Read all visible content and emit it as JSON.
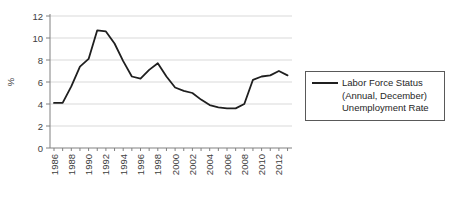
{
  "chart_data": {
    "type": "line",
    "title": "",
    "ylabel": "%",
    "ylim": [
      0,
      12
    ],
    "y_ticks": [
      0,
      2,
      4,
      6,
      8,
      10,
      12
    ],
    "x_tick_labels": [
      1986,
      1988,
      1990,
      1992,
      1994,
      1996,
      1998,
      2000,
      2002,
      2004,
      2006,
      2008,
      2010,
      2012
    ],
    "years": [
      1986,
      1987,
      1988,
      1989,
      1990,
      1991,
      1992,
      1993,
      1994,
      1995,
      1996,
      1997,
      1998,
      1999,
      2000,
      2001,
      2002,
      2003,
      2004,
      2005,
      2006,
      2007,
      2008,
      2009,
      2010,
      2011,
      2012,
      2013
    ],
    "values": [
      4.1,
      4.1,
      5.6,
      7.4,
      8.1,
      10.7,
      10.6,
      9.5,
      7.9,
      6.5,
      6.3,
      7.1,
      7.7,
      6.5,
      5.5,
      5.2,
      5.0,
      4.4,
      3.9,
      3.7,
      3.6,
      3.6,
      4.0,
      6.2,
      6.5,
      6.6,
      7.0,
      6.6
    ],
    "series_name": "Labor Force Status (Annual, December) Unemployment Rate",
    "legend_lines": [
      "Labor Force Status",
      "(Annual, December)",
      "Unemployment Rate"
    ],
    "legend_position": "right",
    "grid": "horizontal",
    "line_color": "#1f1f1f",
    "gridline_color": "#d9d9d9",
    "axis_color": "#808080",
    "label_color": "#3d3d3d"
  }
}
